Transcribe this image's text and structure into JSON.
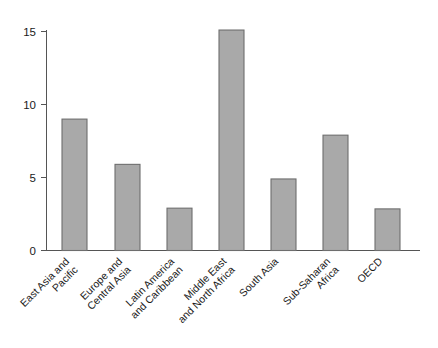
{
  "chart_data": {
    "type": "bar",
    "title": "",
    "subtitle": "",
    "xlabel": "",
    "ylabel": "",
    "categories": [
      "East Asia and Pacific",
      "Europe and Central Asia",
      "Latin America and Caribbean",
      "Middle East and North Africa",
      "South Asia",
      "Sub-Saharan Africa",
      "OECD"
    ],
    "category_lines": [
      [
        "East Asia and",
        "Pacific"
      ],
      [
        "Europe and",
        "Central Asia"
      ],
      [
        "Latin America",
        "and Caribbean"
      ],
      [
        "Middle East",
        "and North Africa"
      ],
      [
        "South Asia"
      ],
      [
        "Sub-Saharan",
        "Africa"
      ],
      [
        "OECD"
      ]
    ],
    "values": [
      9.0,
      5.9,
      2.9,
      15.1,
      4.9,
      7.9,
      2.85
    ],
    "ylim": [
      0,
      15.6
    ],
    "yticks": [
      0,
      5,
      10,
      15
    ],
    "ytick_labels": [
      "0",
      "5",
      "10",
      "15"
    ],
    "grid": false,
    "legend": false,
    "legend_position": "none",
    "bar_color": "#a9a9a9",
    "bar_edge_color": "#6e6e6e",
    "axis_color": "#555555",
    "background_color": "#ffffff",
    "label_rotation_degrees": 45
  }
}
